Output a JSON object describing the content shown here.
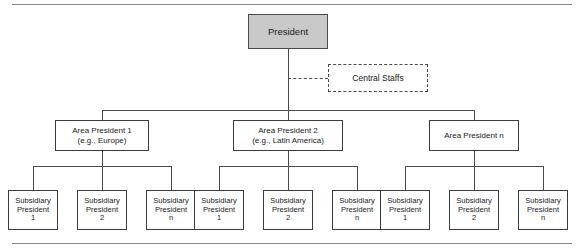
{
  "diagram": {
    "type": "organization-chart",
    "title_text": "",
    "colors": {
      "president_fill": "#c9c9c9",
      "box_border": "#3c3c3c",
      "connector": "#4a4a4a",
      "rule": "#8a8a8a",
      "background": "#ffffff",
      "text": "#1a1a1a"
    },
    "president": {
      "label": "President"
    },
    "central_staffs": {
      "label": "Central Staffs",
      "style": "dashed"
    },
    "areas": [
      {
        "label": "Area President 1\n(e.g., Europe)",
        "subsidiaries": [
          {
            "label": "Subsidiary\nPresident\n1"
          },
          {
            "label": "Subsidiary\nPresident\n2"
          },
          {
            "label": "Subsidiary\nPresident\nn"
          }
        ]
      },
      {
        "label": "Area President 2\n(e.g., Latin America)",
        "subsidiaries": [
          {
            "label": "Subsidiary\nPresident\n1"
          },
          {
            "label": "Subsidiary\nPresident\n2"
          },
          {
            "label": "Subsidiary\nPresident\nn"
          }
        ]
      },
      {
        "label": "Area President n",
        "subsidiaries": [
          {
            "label": "Subsidiary\nPresident\n1"
          },
          {
            "label": "Subsidiary\nPresident\n2"
          },
          {
            "label": "Subsidiary\nPresident\nn"
          }
        ]
      }
    ]
  }
}
